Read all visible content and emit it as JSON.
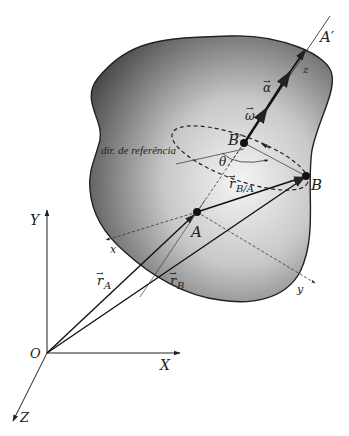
{
  "diagram": {
    "type": "rigid-body-kinematics",
    "labels": {
      "axis_prime": "A′",
      "z_local": "z",
      "alpha": "α",
      "omega": "ω",
      "B_prime": "B′",
      "reference_direction": "dir. de referência",
      "theta": "θ",
      "r_BA": "r",
      "r_BA_sub": "B/A",
      "B": "B",
      "A": "A",
      "x_local": "x",
      "y_local": "y",
      "Y": "Y",
      "X": "X",
      "Z": "Z",
      "O": "O",
      "r_A": "r",
      "r_A_sub": "A",
      "r_B": "r",
      "r_B_sub": "B",
      "vec_arrow": "→"
    },
    "colors": {
      "body_dark": "#5a5a5a",
      "body_light": "#f2f2f2",
      "line": "#222222",
      "background": "#ffffff"
    }
  }
}
